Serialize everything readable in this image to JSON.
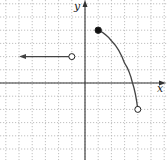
{
  "chart_data": {
    "type": "line",
    "title": "",
    "xlabel": "x",
    "ylabel": "y",
    "xlim": [
      -6,
      6
    ],
    "ylim": [
      -6,
      6
    ],
    "grid": true,
    "grid_style": "dotted",
    "unit_px": 13.2,
    "origin_px": [
      85,
      83
    ],
    "series": [
      {
        "name": "left-ray",
        "kind": "horizontal-ray",
        "y": 2,
        "x_from": -1,
        "extends": "left",
        "arrow_to_x": -5,
        "end_point": {
          "x": -1,
          "y": 2,
          "style": "open"
        }
      },
      {
        "name": "right-curve",
        "kind": "decreasing-concave-down-curve",
        "points": [
          [
            1,
            4
          ],
          [
            2,
            3.2
          ],
          [
            3,
            1.5
          ],
          [
            3.6,
            0
          ],
          [
            4,
            -2
          ]
        ],
        "start_point": {
          "x": 1,
          "y": 4,
          "style": "closed"
        },
        "end_point": {
          "x": 4,
          "y": -2,
          "style": "open"
        }
      }
    ]
  },
  "labels": {
    "x_axis": "x",
    "y_axis": "y"
  },
  "colors": {
    "axis": "#333333",
    "grid": "#b0b0b0",
    "curve": "#444444"
  }
}
